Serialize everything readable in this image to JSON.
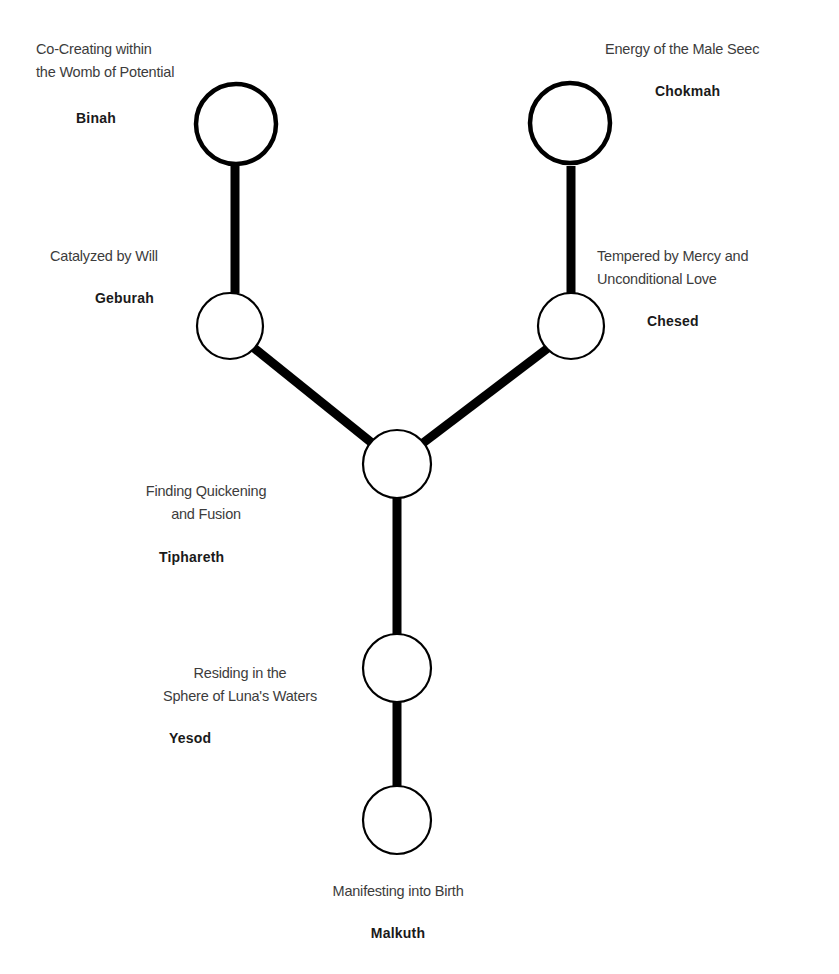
{
  "diagram": {
    "type": "tree-of-life-path",
    "colors": {
      "background": "#ffffff",
      "stroke": "#000000",
      "description_text": "#3c3c3c",
      "name_text": "#1a1a1a"
    },
    "nodes": {
      "binah": {
        "name": "Binah",
        "description_line1": "Co-Creating within",
        "description_line2": "the Womb of Potential"
      },
      "chokmah": {
        "name": "Chokmah",
        "description_line1": "Energy of the Male Seec"
      },
      "geburah": {
        "name": "Geburah",
        "description_line1": "Catalyzed by Will"
      },
      "chesed": {
        "name": "Chesed",
        "description_line1": "Tempered by Mercy and",
        "description_line2": "Unconditional Love"
      },
      "tiphareth": {
        "name": "Tiphareth",
        "description_line1": "Finding Quickening",
        "description_line2": "and Fusion"
      },
      "yesod": {
        "name": "Yesod",
        "description_line1": "Residing in the",
        "description_line2": "Sphere of Luna's Waters"
      },
      "malkuth": {
        "name": "Malkuth",
        "description_line1": "Manifesting into Birth"
      }
    },
    "connections": [
      [
        "binah",
        "geburah"
      ],
      [
        "chokmah",
        "chesed"
      ],
      [
        "geburah",
        "tiphareth"
      ],
      [
        "chesed",
        "tiphareth"
      ],
      [
        "tiphareth",
        "yesod"
      ],
      [
        "yesod",
        "malkuth"
      ]
    ]
  }
}
